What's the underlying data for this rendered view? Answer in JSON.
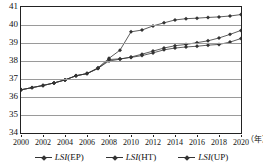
{
  "chart_data": {
    "type": "line",
    "title": "",
    "xlabel": "年",
    "ylabel": "",
    "grid": true,
    "legend_position": "bottom",
    "xlim": [
      2000,
      2020
    ],
    "ylim": [
      34,
      41
    ],
    "yticks": [
      41,
      40,
      39,
      38,
      37,
      36,
      35,
      34
    ],
    "xticks": [
      2000,
      2002,
      2004,
      2006,
      2008,
      2010,
      2012,
      2014,
      2016,
      2018,
      2020
    ],
    "x": [
      2000,
      2001,
      2002,
      2003,
      2004,
      2005,
      2006,
      2007,
      2008,
      2009,
      2010,
      2011,
      2012,
      2013,
      2014,
      2015,
      2016,
      2017,
      2018,
      2019,
      2020
    ],
    "series": [
      {
        "name": "LSI(EP)",
        "values": [
          36.4,
          36.52,
          36.64,
          36.78,
          36.95,
          37.18,
          37.3,
          37.62,
          38.15,
          38.6,
          39.62,
          39.72,
          39.95,
          40.12,
          40.28,
          40.35,
          40.38,
          40.42,
          40.45,
          40.5,
          40.58
        ]
      },
      {
        "name": "LSI(HT)",
        "values": [
          36.4,
          36.52,
          36.64,
          36.78,
          36.95,
          37.18,
          37.3,
          37.6,
          38.0,
          38.1,
          38.22,
          38.38,
          38.55,
          38.72,
          38.85,
          38.92,
          39.02,
          39.12,
          39.28,
          39.48,
          39.7
        ]
      },
      {
        "name": "LSI(UP)",
        "values": [
          36.4,
          36.52,
          36.64,
          36.78,
          36.95,
          37.18,
          37.3,
          37.58,
          38.08,
          38.12,
          38.2,
          38.3,
          38.45,
          38.62,
          38.72,
          38.78,
          38.82,
          38.88,
          38.92,
          39.05,
          39.25
        ]
      }
    ],
    "colors": {
      "line": "#333333",
      "grid": "#9a9a9a",
      "frame": "#222222"
    }
  }
}
